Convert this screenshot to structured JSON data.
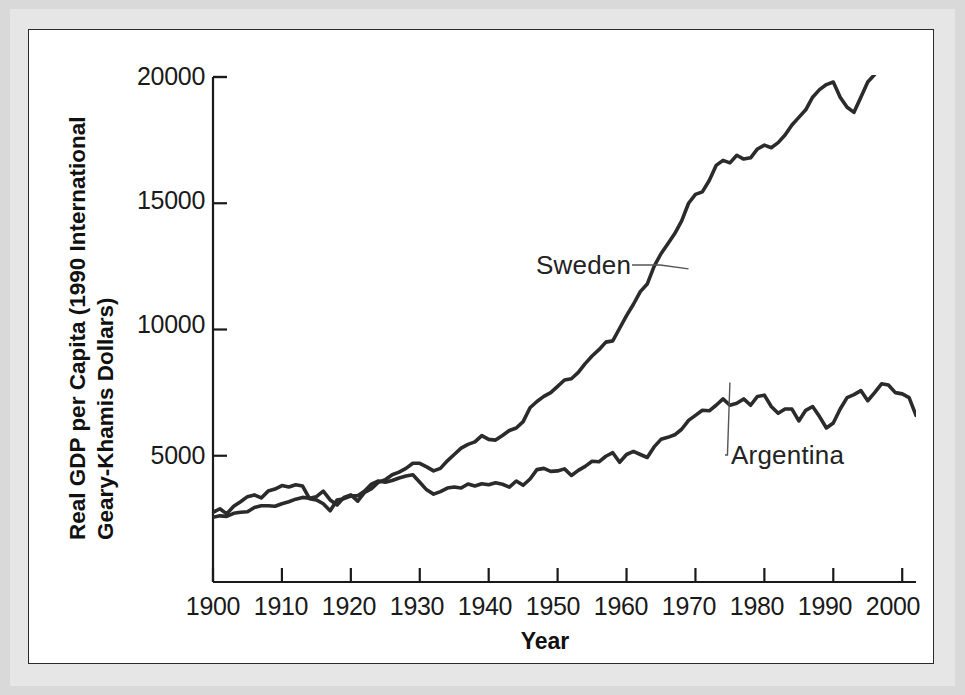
{
  "figure": {
    "panel_background": "#ffffff",
    "mat_color": "#e0e0e0",
    "line_color": "#2b2b2b",
    "axis_color": "#1a1a1a"
  },
  "axis_titles": {
    "x": "Year",
    "y_line1": "Real GDP per Capita (1990 International",
    "y_line2": "Geary-Khamis Dollars)"
  },
  "ticks": {
    "y": [
      "5000",
      "10000",
      "15000",
      "20000"
    ],
    "x": [
      "1900",
      "1910",
      "1920",
      "1930",
      "1940",
      "1950",
      "1960",
      "1970",
      "1980",
      "1990",
      "2000"
    ]
  },
  "annotations": [
    {
      "label": "Sweden",
      "x": 1958.0,
      "y": 12450
    },
    {
      "label": "Argentina",
      "x": 1981.5,
      "y": 5950
    }
  ],
  "chart_data": {
    "type": "line",
    "title": "",
    "xlabel": "Year",
    "ylabel": "Real GDP per Capita (1990 International Geary-Khamis Dollars)",
    "xlim": [
      1900,
      2002
    ],
    "ylim": [
      0,
      20000
    ],
    "yticks": [
      5000,
      10000,
      15000,
      20000
    ],
    "xticks": [
      1900,
      1910,
      1920,
      1930,
      1940,
      1950,
      1960,
      1970,
      1980,
      1990,
      2000
    ],
    "grid": false,
    "legend": "inline-annotations",
    "x": [
      1900,
      1901,
      1902,
      1903,
      1904,
      1905,
      1906,
      1907,
      1908,
      1909,
      1910,
      1911,
      1912,
      1913,
      1914,
      1915,
      1916,
      1917,
      1918,
      1919,
      1920,
      1921,
      1922,
      1923,
      1924,
      1925,
      1926,
      1927,
      1928,
      1929,
      1930,
      1931,
      1932,
      1933,
      1934,
      1935,
      1936,
      1937,
      1938,
      1939,
      1940,
      1941,
      1942,
      1943,
      1944,
      1945,
      1946,
      1947,
      1948,
      1949,
      1950,
      1951,
      1952,
      1953,
      1954,
      1955,
      1956,
      1957,
      1958,
      1959,
      1960,
      1961,
      1962,
      1963,
      1964,
      1965,
      1966,
      1967,
      1968,
      1969,
      1970,
      1971,
      1972,
      1973,
      1974,
      1975,
      1976,
      1977,
      1978,
      1979,
      1980,
      1981,
      1982,
      1983,
      1984,
      1985,
      1986,
      1987,
      1988,
      1989,
      1990,
      1991,
      1992,
      1993,
      1994,
      1995,
      1996,
      1997,
      1998,
      1999,
      2000,
      2001,
      2002
    ],
    "series": [
      {
        "name": "Argentina",
        "color": "#2b2b2b",
        "values": [
          2756,
          2900,
          2700,
          3000,
          3180,
          3380,
          3450,
          3330,
          3600,
          3680,
          3820,
          3760,
          3850,
          3800,
          3300,
          3250,
          3100,
          2820,
          3250,
          3300,
          3400,
          3420,
          3600,
          3880,
          4000,
          3950,
          4020,
          4120,
          4200,
          4250,
          3950,
          3650,
          3480,
          3580,
          3720,
          3760,
          3720,
          3880,
          3800,
          3890,
          3850,
          3930,
          3870,
          3760,
          4000,
          3830,
          4080,
          4450,
          4500,
          4380,
          4400,
          4480,
          4220,
          4420,
          4580,
          4780,
          4760,
          4980,
          5120,
          4740,
          5050,
          5170,
          5050,
          4930,
          5350,
          5650,
          5730,
          5830,
          6050,
          6400,
          6600,
          6800,
          6780,
          7000,
          7250,
          7000,
          7080,
          7250,
          7000,
          7350,
          7400,
          6950,
          6680,
          6850,
          6850,
          6380,
          6800,
          6950,
          6550,
          6100,
          6300,
          6850,
          7300,
          7420,
          7580,
          7180,
          7500,
          7850,
          7800,
          7500,
          7450,
          7300,
          6600
        ]
      },
      {
        "name": "Sweden",
        "color": "#2b2b2b",
        "values": [
          2561,
          2620,
          2600,
          2720,
          2760,
          2780,
          2950,
          3020,
          3020,
          3000,
          3100,
          3180,
          3280,
          3350,
          3320,
          3380,
          3600,
          3250,
          3050,
          3350,
          3450,
          3200,
          3550,
          3700,
          3950,
          4050,
          4250,
          4350,
          4500,
          4700,
          4700,
          4560,
          4400,
          4500,
          4800,
          5050,
          5300,
          5450,
          5550,
          5800,
          5650,
          5620,
          5800,
          6000,
          6100,
          6350,
          6900,
          7150,
          7350,
          7500,
          7750,
          8000,
          8050,
          8300,
          8650,
          8950,
          9200,
          9500,
          9550,
          10050,
          10550,
          11000,
          11500,
          11800,
          12500,
          13000,
          13400,
          13800,
          14300,
          15000,
          15350,
          15450,
          15900,
          16500,
          16700,
          16600,
          16900,
          16750,
          16800,
          17150,
          17300,
          17200,
          17400,
          17700,
          18100,
          18400,
          18700,
          19200,
          19500,
          19700,
          19800,
          19200,
          18800,
          18600,
          19200,
          19800,
          20100,
          20800,
          21300,
          22000,
          22700,
          22800,
          23000
        ]
      }
    ],
    "note_on_series_values": "Sweden values above 20000 are drawn clipped at the axis top in the source figure; rendered path follows the printed curve."
  }
}
